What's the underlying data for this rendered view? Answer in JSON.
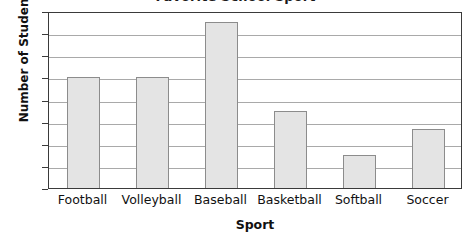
{
  "chart_data": {
    "type": "bar",
    "title": "Favorite School Sport",
    "xlabel": "Sport",
    "ylabel": "Number of Students",
    "categories": [
      "Football",
      "Volleyball",
      "Baseball",
      "Basketball",
      "Softball",
      "Soccer"
    ],
    "values": [
      10,
      10,
      15,
      7,
      3,
      5.3
    ],
    "ylim": [
      0,
      16
    ],
    "yticks": [
      0,
      2,
      4,
      6,
      8,
      10,
      12,
      14,
      16
    ],
    "ytick_labels": [
      "0",
      "2",
      "4",
      "6",
      "8",
      "10",
      "12",
      "14",
      "16"
    ],
    "grid": true,
    "legend": "none",
    "colors": {
      "bar_fill": "#e4e4e4",
      "bar_border": "#8c8c8c",
      "gridline": "#a9a9a9",
      "frame": "#3a3a3a",
      "text": "#111111"
    }
  }
}
